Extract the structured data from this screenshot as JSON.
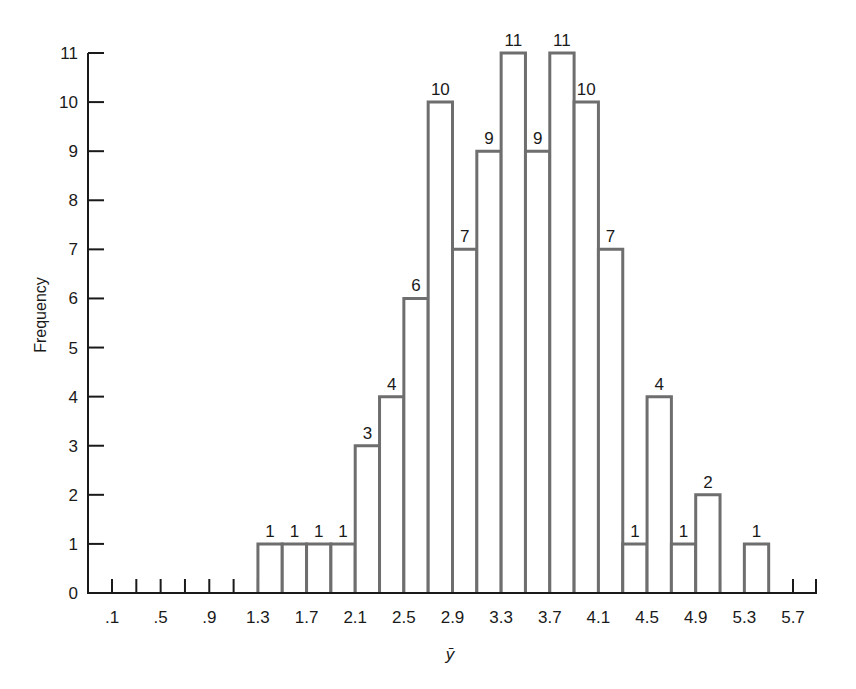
{
  "chart_data": {
    "type": "bar",
    "title": "",
    "xlabel": "ȳ",
    "ylabel": "Frequency",
    "ylim": [
      0,
      11
    ],
    "xlim": [
      -0.1,
      5.9
    ],
    "grid": false,
    "legend": null,
    "bin_width": 0.2,
    "x_tick_labels": [
      ".1",
      ".5",
      ".9",
      "1.3",
      "1.7",
      "2.1",
      "2.5",
      "2.9",
      "3.3",
      "3.7",
      "4.1",
      "4.5",
      "4.9",
      "5.3",
      "5.7"
    ],
    "x_tick_values": [
      0.1,
      0.5,
      0.9,
      1.3,
      1.7,
      2.1,
      2.5,
      2.9,
      3.3,
      3.7,
      4.1,
      4.5,
      4.9,
      5.3,
      5.7
    ],
    "y_tick_labels": [
      "0",
      "1",
      "2",
      "3",
      "4",
      "5",
      "6",
      "7",
      "8",
      "9",
      "10",
      "11"
    ],
    "bins": [
      {
        "from": 1.3,
        "to": 1.5,
        "value": 1
      },
      {
        "from": 1.5,
        "to": 1.7,
        "value": 1
      },
      {
        "from": 1.7,
        "to": 1.9,
        "value": 1
      },
      {
        "from": 1.9,
        "to": 2.1,
        "value": 1
      },
      {
        "from": 2.1,
        "to": 2.3,
        "value": 3
      },
      {
        "from": 2.3,
        "to": 2.5,
        "value": 4
      },
      {
        "from": 2.5,
        "to": 2.7,
        "value": 6
      },
      {
        "from": 2.7,
        "to": 2.9,
        "value": 10
      },
      {
        "from": 2.9,
        "to": 3.1,
        "value": 7
      },
      {
        "from": 3.1,
        "to": 3.3,
        "value": 9
      },
      {
        "from": 3.3,
        "to": 3.5,
        "value": 11
      },
      {
        "from": 3.5,
        "to": 3.7,
        "value": 9
      },
      {
        "from": 3.7,
        "to": 3.9,
        "value": 11
      },
      {
        "from": 3.9,
        "to": 4.1,
        "value": 10
      },
      {
        "from": 4.1,
        "to": 4.3,
        "value": 7
      },
      {
        "from": 4.3,
        "to": 4.5,
        "value": 1
      },
      {
        "from": 4.5,
        "to": 4.7,
        "value": 4
      },
      {
        "from": 4.7,
        "to": 4.9,
        "value": 1
      },
      {
        "from": 4.9,
        "to": 5.1,
        "value": 2
      },
      {
        "from": 5.3,
        "to": 5.5,
        "value": 1
      }
    ],
    "categories": [
      "1.3-1.5",
      "1.5-1.7",
      "1.7-1.9",
      "1.9-2.1",
      "2.1-2.3",
      "2.3-2.5",
      "2.5-2.7",
      "2.7-2.9",
      "2.9-3.1",
      "3.1-3.3",
      "3.3-3.5",
      "3.5-3.7",
      "3.7-3.9",
      "3.9-4.1",
      "4.1-4.3",
      "4.3-4.5",
      "4.5-4.7",
      "4.7-4.9",
      "4.9-5.1",
      "5.3-5.5"
    ],
    "values": [
      1,
      1,
      1,
      1,
      3,
      4,
      6,
      10,
      7,
      9,
      11,
      9,
      11,
      10,
      7,
      1,
      4,
      1,
      2,
      1
    ]
  },
  "colors": {
    "axis": "#1a1a1a",
    "bar_stroke": "#6e6e6e",
    "bar_fill": "#ffffff",
    "background": "#ffffff"
  }
}
